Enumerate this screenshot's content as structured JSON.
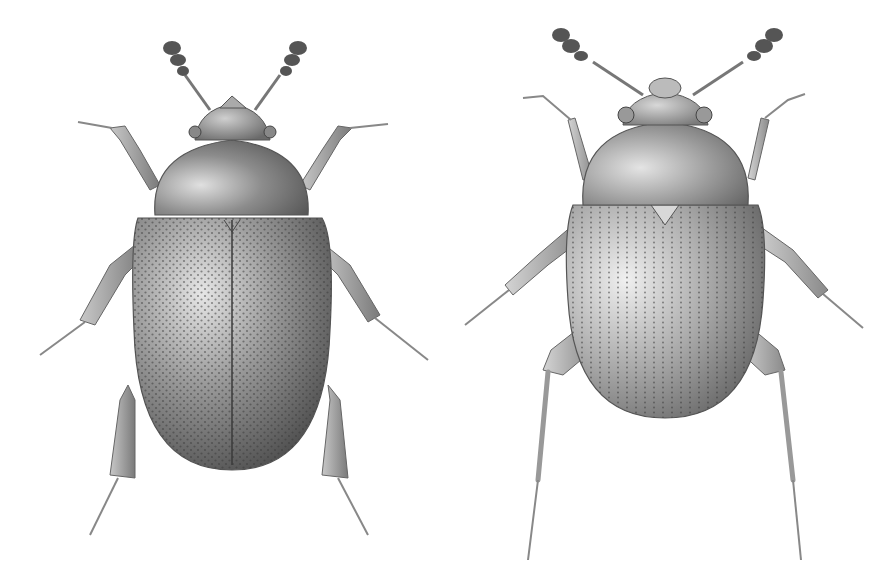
{
  "figure": {
    "background": "#ffffff",
    "style": "stippled pencil scientific illustration, grayscale",
    "specimens": [
      {
        "id": "left",
        "view": "dorsal",
        "body_shape": "elongate oval",
        "elytra_texture": "dense irregular punctures",
        "legs": "hairy/setose, broad tibiae",
        "antennae": "clubbed, 3-segment club",
        "tone": "#6e6e6e"
      },
      {
        "id": "right",
        "view": "dorsal",
        "body_shape": "broad oval",
        "elytra_texture": "punctate striae (rows of dots)",
        "legs": "slender, long hind legs with spines",
        "antennae": "clubbed, 3-segment club",
        "tone": "#8a8a8a"
      }
    ]
  }
}
